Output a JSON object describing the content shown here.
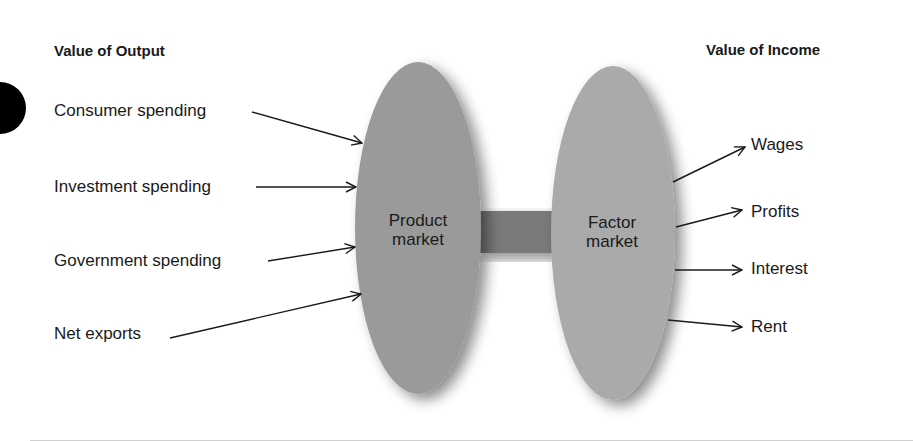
{
  "diagram": {
    "title_left": "Value of Output",
    "title_right": "Value of Income",
    "nodes": {
      "product_market": {
        "line1": "Product",
        "line2": "market"
      },
      "factor_market": {
        "line1": "Factor",
        "line2": "market"
      }
    },
    "inputs": [
      {
        "label": "Consumer spending"
      },
      {
        "label": "Investment spending"
      },
      {
        "label": "Government spending"
      },
      {
        "label": "Net exports"
      }
    ],
    "outputs": [
      {
        "label": "Wages"
      },
      {
        "label": "Profits"
      },
      {
        "label": "Interest"
      },
      {
        "label": "Rent"
      }
    ],
    "colors": {
      "product_market": "#9a9a9a",
      "factor_market": "#a9a9a9",
      "connector": "#7a7a7a",
      "arrow": "#1a1a1a"
    }
  }
}
